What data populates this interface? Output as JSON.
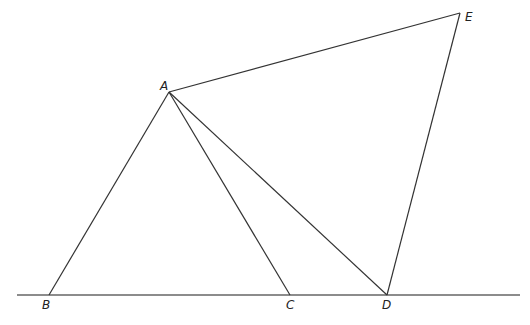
{
  "diagram": {
    "type": "geometry",
    "points": {
      "A": {
        "label": "A",
        "x": 169,
        "y": 92,
        "lx": 160,
        "ly": 90
      },
      "B": {
        "label": "B",
        "x": 49,
        "y": 295,
        "lx": 42,
        "ly": 309
      },
      "C": {
        "label": "C",
        "x": 290,
        "y": 295,
        "lx": 286,
        "ly": 309
      },
      "D": {
        "label": "D",
        "x": 387,
        "y": 295,
        "lx": 382,
        "ly": 309
      },
      "E": {
        "label": "E",
        "x": 460,
        "y": 13,
        "lx": 465,
        "ly": 21
      }
    },
    "segments": [
      {
        "from": "A",
        "to": "B"
      },
      {
        "from": "A",
        "to": "C"
      },
      {
        "from": "A",
        "to": "D"
      },
      {
        "from": "A",
        "to": "E"
      },
      {
        "from": "E",
        "to": "D"
      }
    ],
    "baseline": {
      "x1": 17,
      "y1": 295,
      "x2": 520,
      "y2": 295
    },
    "colors": {
      "line": "#333333",
      "baseline": "#666666",
      "label": "#222222"
    }
  }
}
